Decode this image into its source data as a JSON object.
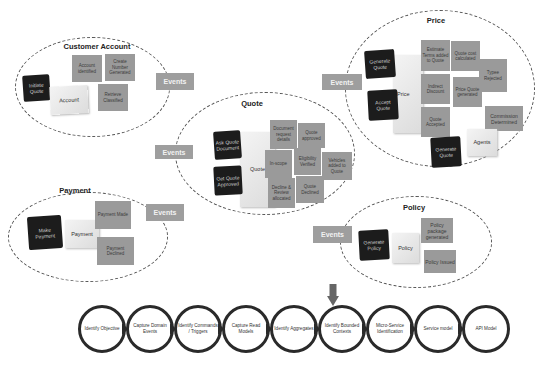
{
  "contexts": {
    "customer_account": {
      "title": "Customer Account",
      "command": "Initiate Quote",
      "aggregate": "Account",
      "events": [
        "Account identified",
        "Create Number Generated",
        "Retrieve Classified"
      ]
    },
    "price": {
      "title": "Price",
      "commands": [
        "Generate Quote",
        "Accept Quote",
        "Generate Quote"
      ],
      "aggregates": [
        "Price",
        "Agents"
      ],
      "events": [
        "Estimate Terms added to Quote",
        "Quote cost calculated",
        "Typee Rejected",
        "Indirect Discount",
        "Price Quote generated",
        "Quote Accepted",
        "Commission Determined"
      ]
    },
    "quote": {
      "title": "Quote",
      "commands": [
        "Ask Quote Document",
        "Get Quote Approved"
      ],
      "aggregate": "Quote",
      "events": [
        "Document request details",
        "Quote approved",
        "In-scope",
        "Eligibility Verified",
        "Vehicles added to Quote",
        "Decline & Review allocated",
        "Quote Declined"
      ]
    },
    "payment": {
      "title": "Payment",
      "command": "Make Payment",
      "aggregate": "Payment",
      "events": [
        "Payment Made",
        "Payment Declined"
      ]
    },
    "policy": {
      "title": "Policy",
      "command": "Generate Policy",
      "aggregate": "Policy",
      "events": [
        "Policy package generated",
        "Policy Issued"
      ]
    }
  },
  "events_label": "Events",
  "process_steps": [
    "Identify Objective",
    "Capture Domain Events",
    "Identify Commands / Triggers",
    "Capture Read Models",
    "Identify Aggregates",
    "Identify Bounded Contexts",
    "Micro-Service Identification",
    "Service model",
    "API Model"
  ],
  "highlighted_step": "Identify Bounded Contexts",
  "colors": {
    "event_note": "#9a9a9a",
    "command_note": "#1c1c1c",
    "aggregate_note": "#e8e8e8",
    "chain_ring": "#2a2a2a",
    "arrow": "#666666"
  }
}
